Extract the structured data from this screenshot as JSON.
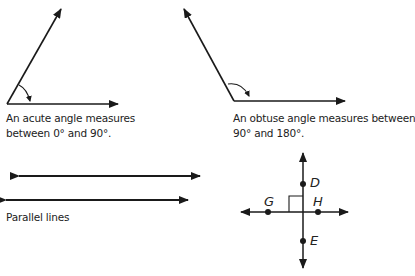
{
  "acute": {
    "caption_line1": "An acute angle measures",
    "caption_line2": "between 0° and 90°."
  },
  "obtuse": {
    "caption_line1": "An obtuse angle measures between",
    "caption_line2": "90° and 180°."
  },
  "parallel": {
    "caption": "Parallel lines"
  },
  "perpendicular": {
    "points": [
      {
        "name": "D"
      },
      {
        "name": "G"
      },
      {
        "name": "H"
      },
      {
        "name": "E"
      }
    ]
  },
  "colors": {
    "ink": "#1a1a1a",
    "background": "#ffffff"
  }
}
